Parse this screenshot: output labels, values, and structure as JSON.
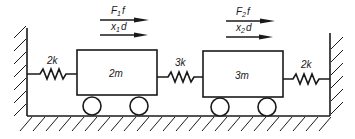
{
  "diagram": {
    "masses": [
      {
        "id": "mass-1",
        "label": "2m",
        "force_label": "F",
        "force_sub": "1",
        "force_suffix": "f",
        "disp_label": "x",
        "disp_sub": "1",
        "disp_suffix": "d"
      },
      {
        "id": "mass-2",
        "label": "3m",
        "force_label": "F",
        "force_sub": "2",
        "force_suffix": "f",
        "disp_label": "x",
        "disp_sub": "2",
        "disp_suffix": "d"
      }
    ],
    "springs": [
      {
        "id": "spring-left",
        "label": "2k"
      },
      {
        "id": "spring-middle",
        "label": "3k"
      },
      {
        "id": "spring-right",
        "label": "2k"
      }
    ],
    "colors": {
      "stroke": "#1a1a1a",
      "background": "#ffffff"
    }
  }
}
